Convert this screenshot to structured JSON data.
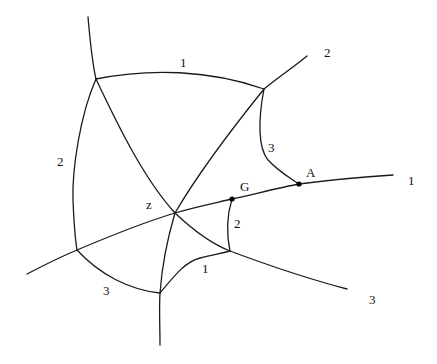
{
  "diagram": {
    "type": "curve-network",
    "colors": {
      "stroke": "#1a1a1a",
      "background": "#ffffff",
      "point": "#000000"
    },
    "labels": {
      "top_1": "1",
      "top_right_2": "2",
      "right_3": "3",
      "A": "A",
      "right_1": "1",
      "left_2": "2",
      "z": "z",
      "G": "G",
      "G_2": "2",
      "bottom_1": "1",
      "bottom_left_3": "3",
      "bottom_right_3": "3"
    },
    "points": [
      {
        "name": "G",
        "x": 232,
        "y": 199
      },
      {
        "name": "A",
        "x": 299,
        "y": 184
      }
    ]
  }
}
